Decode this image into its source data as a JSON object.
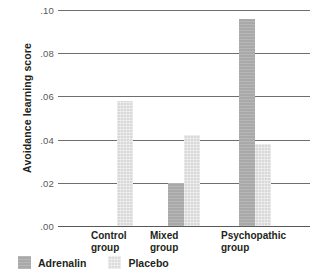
{
  "chart_data": {
    "type": "bar",
    "title": "",
    "xlabel": "",
    "ylabel": "Avoidance learning score",
    "categories": [
      "Control group",
      "Mixed group",
      "Psychopathic group"
    ],
    "category_lines": [
      [
        "Control",
        "group"
      ],
      [
        "Mixed",
        "group"
      ],
      [
        "Psychopathic",
        "group"
      ]
    ],
    "series": [
      {
        "name": "Adrenalin",
        "color": "#a9a9a9",
        "values": [
          null,
          0.02,
          0.096
        ]
      },
      {
        "name": "Placebo",
        "color": "#d9d9d9",
        "values": [
          0.058,
          0.042,
          0.038
        ]
      }
    ],
    "ylim": [
      0.0,
      0.1
    ],
    "yticks": [
      0.0,
      0.02,
      0.04,
      0.06,
      0.08,
      0.1
    ],
    "ytick_labels": [
      ".00",
      ".02",
      ".04",
      ".06",
      ".08",
      ".10"
    ],
    "grid": true,
    "legend_position": "bottom-left"
  },
  "legend": {
    "entries": [
      {
        "label": "Adrenalin"
      },
      {
        "label": "Placebo"
      }
    ]
  }
}
